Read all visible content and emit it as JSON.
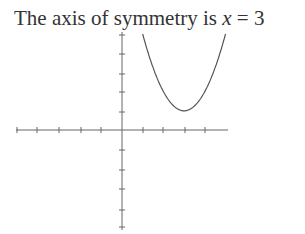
{
  "caption": {
    "text": "The axis of symmetry is ",
    "var": "x",
    "eq": " = 3"
  },
  "chart_data": {
    "type": "line",
    "title": "",
    "function": "y = (x - 3)^2 + 1",
    "vertex": [
      3,
      1
    ],
    "axis_of_symmetry": "x = 3",
    "xlim": [
      -5,
      5
    ],
    "ylim": [
      -5,
      5
    ],
    "x": [
      1,
      1.5,
      2,
      2.5,
      3,
      3.5,
      4,
      4.5,
      5
    ],
    "series": [
      {
        "name": "parabola",
        "values": [
          5,
          3.25,
          2,
          1.25,
          1,
          1.25,
          2,
          3.25,
          5
        ]
      }
    ],
    "grid": false,
    "xlabel": "",
    "ylabel": "",
    "tick_labels": false
  }
}
